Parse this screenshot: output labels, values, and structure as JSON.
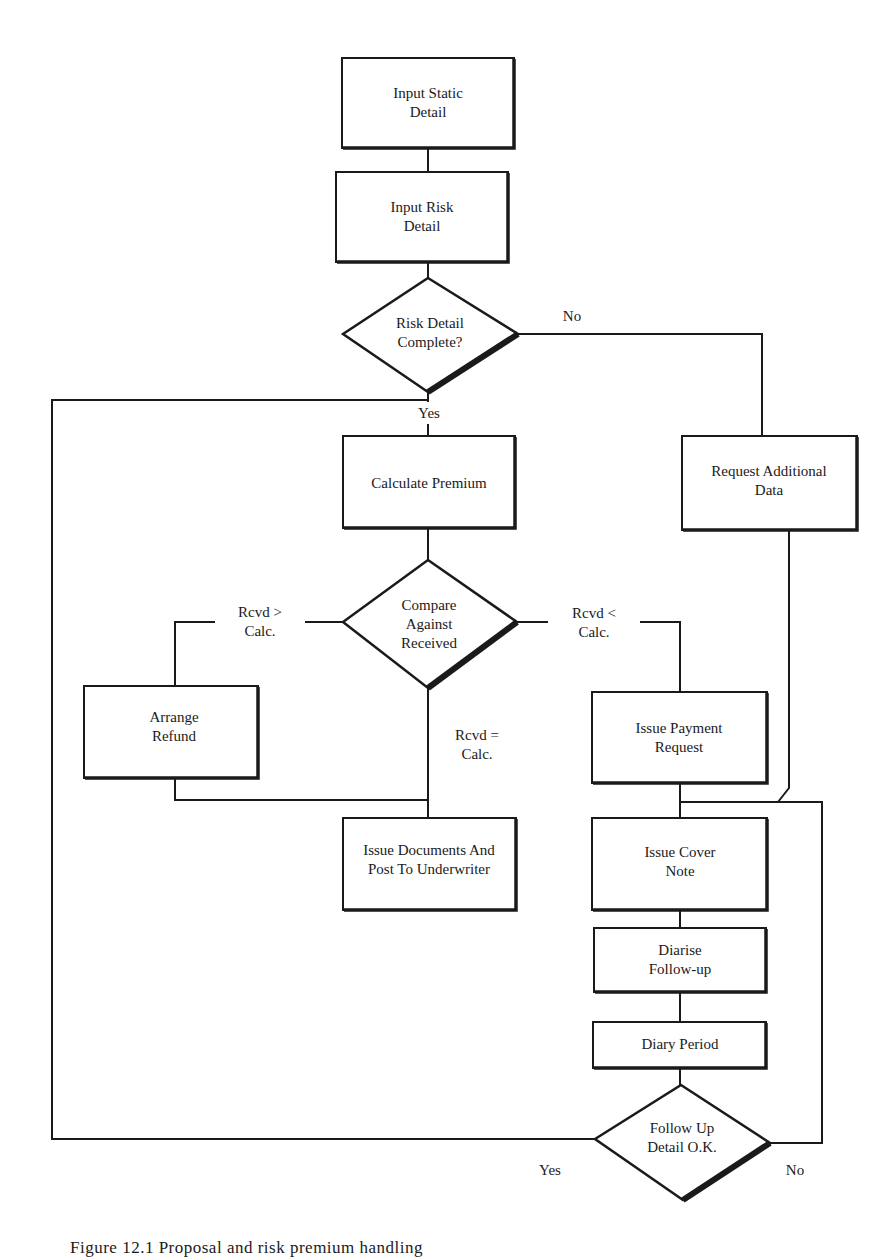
{
  "diagram": {
    "type": "flowchart",
    "nodes": [
      {
        "id": "input_static",
        "shape": "process",
        "lines": [
          "Input Static",
          "Detail"
        ]
      },
      {
        "id": "input_risk",
        "shape": "process",
        "lines": [
          "Input Risk",
          "Detail"
        ]
      },
      {
        "id": "risk_complete",
        "shape": "decision",
        "lines": [
          "Risk Detail",
          "Complete?"
        ]
      },
      {
        "id": "request_additional",
        "shape": "process",
        "lines": [
          "Request Additional",
          "Data"
        ]
      },
      {
        "id": "calc_premium",
        "shape": "process",
        "lines": [
          "Calculate Premium"
        ]
      },
      {
        "id": "compare",
        "shape": "decision",
        "lines": [
          "Compare",
          "Against",
          "Received"
        ]
      },
      {
        "id": "arrange_refund",
        "shape": "process",
        "lines": [
          "Arrange",
          "Refund"
        ]
      },
      {
        "id": "issue_documents",
        "shape": "process",
        "lines": [
          "Issue Documents And",
          "Post To Underwriter"
        ]
      },
      {
        "id": "issue_payment",
        "shape": "process",
        "lines": [
          "Issue Payment",
          "Request"
        ]
      },
      {
        "id": "issue_cover",
        "shape": "process",
        "lines": [
          "Issue Cover",
          "Note"
        ]
      },
      {
        "id": "diarise",
        "shape": "process",
        "lines": [
          "Diarise",
          "Follow-up"
        ]
      },
      {
        "id": "diary_period",
        "shape": "process",
        "lines": [
          "Diary Period"
        ]
      },
      {
        "id": "followup_ok",
        "shape": "decision",
        "lines": [
          "Follow Up",
          "Detail O.K."
        ]
      }
    ],
    "edge_labels": {
      "risk_no": "No",
      "risk_yes": "Yes",
      "rcvd_gt": [
        "Rcvd >",
        "Calc."
      ],
      "rcvd_eq": [
        "Rcvd =",
        "Calc."
      ],
      "rcvd_lt": [
        "Rcvd <",
        "Calc."
      ],
      "followup_yes": "Yes",
      "followup_no": "No"
    },
    "edges": [
      {
        "from": "input_static",
        "to": "input_risk"
      },
      {
        "from": "input_risk",
        "to": "risk_complete"
      },
      {
        "from": "risk_complete",
        "to": "request_additional",
        "label": "No"
      },
      {
        "from": "risk_complete",
        "to": "calc_premium",
        "label": "Yes"
      },
      {
        "from": "calc_premium",
        "to": "compare"
      },
      {
        "from": "compare",
        "to": "arrange_refund",
        "label": "Rcvd > Calc."
      },
      {
        "from": "compare",
        "to": "issue_documents",
        "label": "Rcvd = Calc."
      },
      {
        "from": "compare",
        "to": "issue_payment",
        "label": "Rcvd < Calc."
      },
      {
        "from": "arrange_refund",
        "to": "issue_documents"
      },
      {
        "from": "issue_payment",
        "to": "issue_cover"
      },
      {
        "from": "request_additional",
        "to": "issue_cover"
      },
      {
        "from": "issue_cover",
        "to": "diarise"
      },
      {
        "from": "diarise",
        "to": "diary_period"
      },
      {
        "from": "diary_period",
        "to": "followup_ok"
      },
      {
        "from": "followup_ok",
        "to": "calc_premium",
        "label": "Yes"
      },
      {
        "from": "followup_ok",
        "to": "issue_cover",
        "label": "No"
      }
    ]
  },
  "caption": "Figure 12.1    Proposal and risk premium handling"
}
